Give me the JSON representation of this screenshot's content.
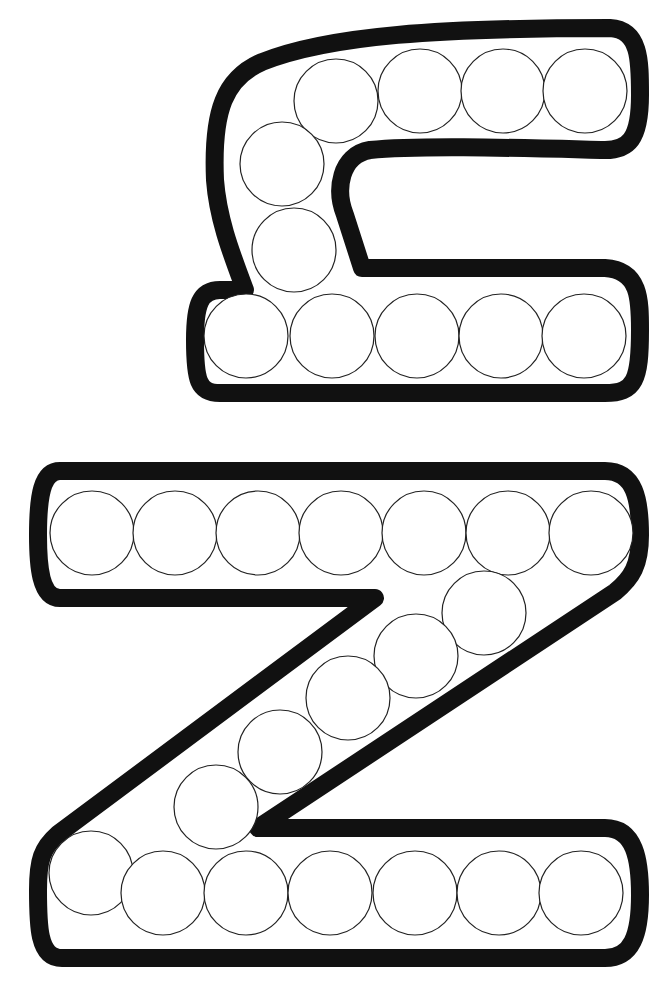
{
  "worksheet": {
    "title": "Dot marker letter Z worksheet",
    "colors": {
      "outline": "#111111",
      "dot_stroke": "#222222",
      "background": "#ffffff"
    },
    "letters": [
      {
        "name": "lowercase z",
        "label": "z",
        "dot_count": 12
      },
      {
        "name": "uppercase Z",
        "label": "Z",
        "dot_count": 21
      }
    ]
  }
}
